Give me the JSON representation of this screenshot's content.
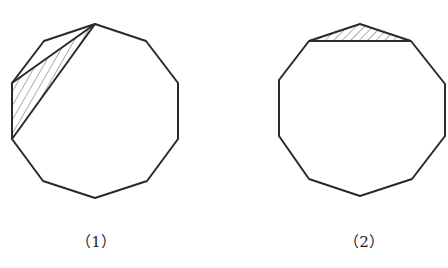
{
  "figures": [
    {
      "label": "（1）",
      "shape": "regular decagon",
      "shaded_region": "triangle formed by top vertex and two left vertices (two diagonals)"
    },
    {
      "label": "（2）",
      "shape": "regular decagon",
      "shaded_region": "triangle formed by top vertex and its two neighbouring vertices"
    }
  ],
  "colors": {
    "stroke": "#2a2a2a",
    "background": "#ffffff"
  }
}
